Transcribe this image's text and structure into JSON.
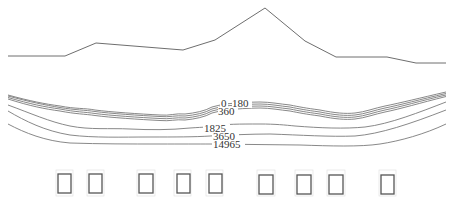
{
  "figure": {
    "type": "cross-section contour diagram",
    "surface_profile": {
      "points": [
        [
          8,
          56
        ],
        [
          65,
          56
        ],
        [
          96,
          43
        ],
        [
          183,
          50
        ],
        [
          215,
          40
        ],
        [
          265,
          8
        ],
        [
          305,
          41
        ],
        [
          336,
          57
        ],
        [
          387,
          57
        ],
        [
          416,
          63
        ],
        [
          446,
          63
        ]
      ]
    },
    "contours": [
      {
        "label": "0",
        "label_pos": [
          224,
          134
        ]
      },
      {
        "label": "180",
        "label_pos": [
          234,
          106
        ]
      },
      {
        "label": "360",
        "label_pos": [
          220,
          115
        ]
      },
      {
        "label": "1825",
        "label_pos": [
          205,
          131
        ]
      },
      {
        "label": "3650",
        "label_pos": [
          213,
          140
        ]
      },
      {
        "label": "14965",
        "label_pos": [
          212,
          151
        ]
      }
    ],
    "boxes": [
      {
        "x": 58
      },
      {
        "x": 89
      },
      {
        "x": 139
      },
      {
        "x": 176
      },
      {
        "x": 208
      },
      {
        "x": 259
      },
      {
        "x": 297
      },
      {
        "x": 329
      },
      {
        "x": 381
      }
    ],
    "colors": {
      "line": "#6e6e6e",
      "box_stroke": "#555555",
      "background": "#ffffff"
    }
  }
}
